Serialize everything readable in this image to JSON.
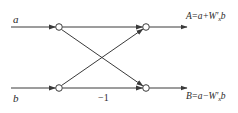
{
  "diagram": {
    "type": "butterfly-signal-flow-graph",
    "inputs": {
      "top": "a",
      "bottom": "b"
    },
    "outputs": {
      "top": {
        "lhs": "A",
        "eq": "=",
        "rhs_prefix": "a+W'",
        "subscript": "x",
        "rhs_suffix": "b"
      },
      "bottom": {
        "lhs": "B",
        "eq": "=",
        "rhs_prefix": "a−W'",
        "subscript": "x",
        "rhs_suffix": "b"
      }
    },
    "branch_coefficient": "−1",
    "colors": {
      "line": "#3a3a3a",
      "text": "#2a2a2a",
      "background": "#ffffff"
    }
  }
}
